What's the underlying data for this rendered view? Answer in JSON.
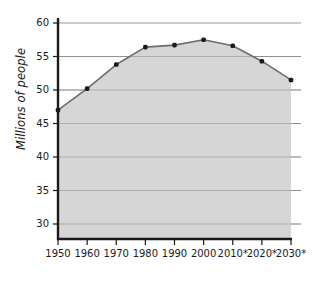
{
  "chart_data": {
    "type": "area",
    "title": "",
    "subtitle": "",
    "xlabel": "",
    "ylabel": "Millions of people",
    "categories": [
      "1950",
      "1960",
      "1970",
      "1980",
      "1990",
      "2000",
      "2010*",
      "2020*",
      "2030*"
    ],
    "values": [
      47.0,
      50.2,
      53.8,
      56.4,
      56.7,
      57.5,
      56.6,
      54.3,
      51.5
    ],
    "series": [
      {
        "name": "Population",
        "values": [
          47.0,
          50.2,
          53.8,
          56.4,
          56.7,
          57.5,
          56.6,
          54.3,
          51.5
        ]
      }
    ],
    "ylim": [
      28,
      60
    ],
    "yticks": [
      30,
      35,
      40,
      45,
      50,
      55,
      60
    ],
    "ytick_labels": [
      "30",
      "35",
      "40",
      "45",
      "50",
      "55",
      "60"
    ],
    "xtick_labels": [
      "1950",
      "1960",
      "1970",
      "1980",
      "1990",
      "2000",
      "2010*",
      "2020*",
      "2030*"
    ],
    "grid": true,
    "legend": "none",
    "annotations": [],
    "colors": {
      "area_fill": "#d6d6d6",
      "line": "#6d6d6d",
      "marker": "#1a1a1a",
      "gridline": "#9a9a9a",
      "axis": "#1a1a1a",
      "background": "#ffffff",
      "text": "#1a1a1a"
    }
  }
}
